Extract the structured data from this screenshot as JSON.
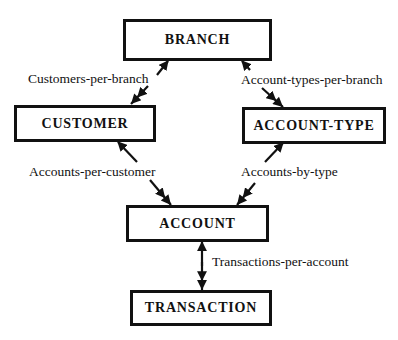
{
  "diagram": {
    "type": "entity-relationship hierarchy",
    "entities": {
      "branch": {
        "label": "BRANCH"
      },
      "customer": {
        "label": "CUSTOMER"
      },
      "account_type": {
        "label": "ACCOUNT-TYPE"
      },
      "account": {
        "label": "ACCOUNT"
      },
      "transaction": {
        "label": "TRANSACTION"
      }
    },
    "relationships": {
      "customers_per_branch": {
        "label": "Customers-per-branch",
        "from": "BRANCH",
        "to": "CUSTOMER",
        "cardinality": "one-to-many"
      },
      "account_types_per_branch": {
        "label": "Account-types-per-branch",
        "from": "BRANCH",
        "to": "ACCOUNT-TYPE",
        "cardinality": "one-to-many"
      },
      "accounts_per_customer": {
        "label": "Accounts-per-customer",
        "from": "CUSTOMER",
        "to": "ACCOUNT",
        "cardinality": "one-to-many"
      },
      "accounts_by_type": {
        "label": "Accounts-by-type",
        "from": "ACCOUNT-TYPE",
        "to": "ACCOUNT",
        "cardinality": "one-to-many"
      },
      "transactions_per_account": {
        "label": "Transactions-per-account",
        "from": "ACCOUNT",
        "to": "TRANSACTION",
        "cardinality": "one-to-many"
      }
    }
  }
}
